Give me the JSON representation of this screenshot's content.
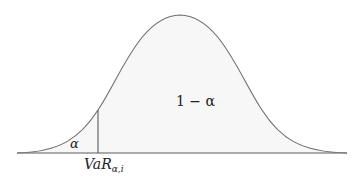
{
  "diagram": {
    "type": "normal-distribution-var",
    "labels": {
      "tail": "α",
      "body": "1 − α",
      "var_main": "VaR",
      "var_sub": "α,i"
    },
    "colors": {
      "curve": "#6e6e6e",
      "baseline": "#5a5a5a",
      "var_line": "#5a5a5a",
      "fill": "#f7f7f7",
      "text": "#222222"
    }
  }
}
